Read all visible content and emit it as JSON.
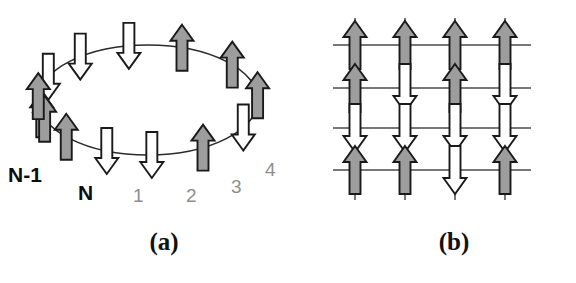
{
  "figure": {
    "panels": [
      {
        "id": "a",
        "caption": "(a)",
        "type": "ring",
        "description": "One-dimensional periodic ring of spins drawn around an ellipse"
      },
      {
        "id": "b",
        "caption": "(b)",
        "type": "square-lattice",
        "description": "Two-dimensional 4 by 4 square lattice of spins"
      }
    ]
  },
  "colors": {
    "spin_up_fill": "#9d9d9d",
    "spin_down_fill": "#ffffff",
    "outline": "#1a1a1a",
    "ring_stroke": "#2b2b2b",
    "lattice_stroke": "#4a4a4a",
    "site_label_bold": "#0d0d0d",
    "site_label_light": "#8e8e8e",
    "caption": "#111111",
    "background": "#ffffff"
  },
  "ring": {
    "ellipse": {
      "cx": 148,
      "cy": 100,
      "rx": 110,
      "ry": 55
    },
    "site_count": 14,
    "spins": [
      {
        "index": 0,
        "angle_deg": 195,
        "direction": "up",
        "fill": "spin_up_fill",
        "label": "N-1"
      },
      {
        "index": 1,
        "angle_deg": 155,
        "direction": "down",
        "fill": "spin_down_fill",
        "label": "N"
      },
      {
        "index": 2,
        "angle_deg": 128,
        "direction": "down",
        "fill": "spin_down_fill",
        "label": "1"
      },
      {
        "index": 3,
        "angle_deg": 100,
        "direction": "down",
        "fill": "spin_down_fill",
        "label": "2"
      },
      {
        "index": 4,
        "angle_deg": 72,
        "direction": "up",
        "fill": "spin_up_fill",
        "label": "3"
      },
      {
        "index": 5,
        "angle_deg": 40,
        "direction": "up",
        "fill": "spin_up_fill",
        "label": "4"
      },
      {
        "index": 6,
        "angle_deg": 5,
        "direction": "up",
        "fill": "spin_up_fill",
        "label": ""
      },
      {
        "index": 7,
        "angle_deg": 330,
        "direction": "down",
        "fill": "spin_down_fill",
        "label": ""
      },
      {
        "index": 8,
        "angle_deg": 300,
        "direction": "up",
        "fill": "spin_up_fill",
        "label": ""
      },
      {
        "index": 9,
        "angle_deg": 272,
        "direction": "down",
        "fill": "spin_down_fill",
        "label": ""
      },
      {
        "index": 10,
        "angle_deg": 248,
        "direction": "down",
        "fill": "spin_down_fill",
        "label": ""
      },
      {
        "index": 11,
        "angle_deg": 222,
        "direction": "up",
        "fill": "spin_up_fill",
        "label": ""
      },
      {
        "index": 12,
        "angle_deg": 200,
        "direction": "up",
        "fill": "spin_up_fill",
        "label": ""
      },
      {
        "index": 13,
        "angle_deg": 176,
        "direction": "up",
        "fill": "spin_up_fill",
        "label": ""
      }
    ],
    "site_labels": [
      {
        "text": "N-1",
        "x": 8,
        "y": 164,
        "weight": "bold"
      },
      {
        "text": "N",
        "x": 78,
        "y": 182,
        "weight": "bold"
      },
      {
        "text": "1",
        "x": 133,
        "y": 186,
        "weight": "light"
      },
      {
        "text": "2",
        "x": 186,
        "y": 186,
        "weight": "light"
      },
      {
        "text": "3",
        "x": 231,
        "y": 177,
        "weight": "light"
      },
      {
        "text": "4",
        "x": 265,
        "y": 160,
        "weight": "light"
      }
    ]
  },
  "lattice": {
    "rows": 4,
    "cols": 4,
    "x_positions": [
      67,
      117,
      167,
      217
    ],
    "y_positions": [
      45,
      88,
      128,
      170
    ],
    "line_extent": {
      "x_min": 45,
      "x_max": 243,
      "y_min": 18,
      "y_max": 200
    },
    "grid": [
      [
        "up",
        "up",
        "up",
        "up"
      ],
      [
        "up",
        "down",
        "up",
        "down"
      ],
      [
        "down",
        "down",
        "down",
        "down"
      ],
      [
        "up",
        "up",
        "down",
        "up"
      ]
    ]
  }
}
